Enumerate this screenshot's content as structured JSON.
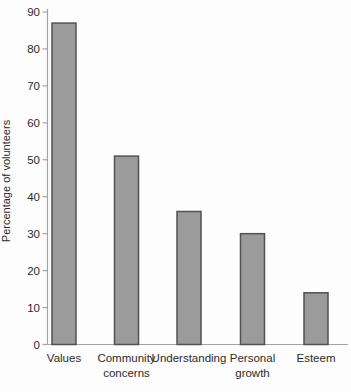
{
  "chart_data": {
    "type": "bar",
    "title": "",
    "xlabel": "",
    "ylabel": "Percentage of volunteers",
    "categories": [
      "Values",
      "Community concerns",
      "Understanding",
      "Personal growth",
      "Esteem"
    ],
    "category_label_lines": [
      [
        "Values"
      ],
      [
        "Community",
        "concerns"
      ],
      [
        "Understanding"
      ],
      [
        "Personal",
        "growth"
      ],
      [
        "Esteem"
      ]
    ],
    "values": [
      87,
      51,
      36,
      30,
      14
    ],
    "ylim": [
      0,
      90
    ],
    "ytick_step": 10,
    "ytick_labels": [
      "0",
      "10",
      "20",
      "30",
      "40",
      "50",
      "60",
      "70",
      "80",
      "90"
    ],
    "grid": false,
    "legend": false,
    "colors": {
      "bar_fill": "#9b9b9b",
      "bar_border": "#525252",
      "axis": "#a3a3a3",
      "text": "#2b2b2b",
      "background": "#fdfdfd"
    }
  }
}
